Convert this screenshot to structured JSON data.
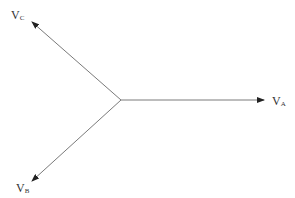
{
  "diagram": {
    "type": "three-phase voltage phasor diagram",
    "line_color": "#7a7a7a",
    "arrow_color": "#222222",
    "origin": {
      "x": 121,
      "y": 100
    },
    "phasors": [
      {
        "id": "A",
        "label": "V",
        "subscript": "A",
        "tip": {
          "x": 264,
          "y": 100
        },
        "label_pos": {
          "x": 272,
          "y": 105
        }
      },
      {
        "id": "B",
        "label": "V",
        "subscript": "B",
        "tip": {
          "x": 32,
          "y": 181
        },
        "label_pos": {
          "x": 16,
          "y": 192
        }
      },
      {
        "id": "C",
        "label": "V",
        "subscript": "C",
        "tip": {
          "x": 32,
          "y": 22
        },
        "label_pos": {
          "x": 11,
          "y": 19
        }
      }
    ]
  }
}
